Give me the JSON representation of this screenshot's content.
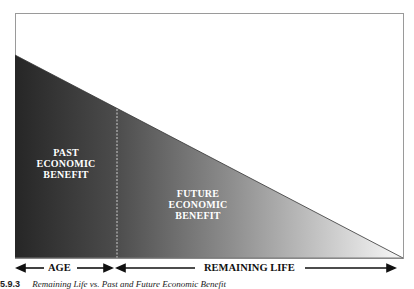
{
  "figure": {
    "regions": {
      "past": {
        "lines": [
          "PAST",
          "ECONOMIC",
          "BENEFIT"
        ]
      },
      "future": {
        "lines": [
          "FUTURE",
          "ECONOMIC",
          "BENEFIT"
        ]
      }
    },
    "axis": {
      "age_label": "AGE",
      "remaining_label": "REMAINING LIFE"
    },
    "caption": {
      "number": "5.9.3",
      "text": "Remaining Life vs. Past and Future Economic Benefit"
    },
    "colors": {
      "dark": "#2a2a2a",
      "mid": "#8a8a8a",
      "light": "#f4f4f4",
      "frame": "#9a9a9a"
    }
  }
}
